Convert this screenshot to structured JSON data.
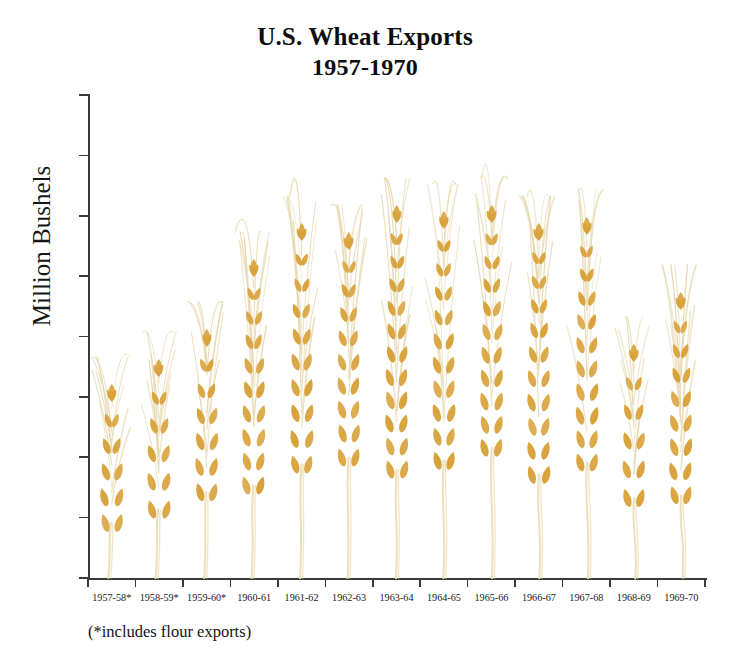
{
  "title": {
    "line1": "U.S. Wheat Exports",
    "line2": "1957-1970"
  },
  "axis": {
    "ylabel": "Million Bushels",
    "yticks": [
      0,
      100,
      200,
      300,
      400,
      500,
      600,
      700,
      800
    ],
    "ylim": [
      0,
      800
    ]
  },
  "footnote": "(*includes flour exports)",
  "colors": {
    "grain": "#d9a33c",
    "grain_light": "#e8c684",
    "stem": "#ede0bd",
    "awn": "#e6d8ae",
    "axis": "#3a3a3a",
    "text": "#141414",
    "background": "#ffffff"
  },
  "chart_data": {
    "type": "bar",
    "title": "U.S. Wheat Exports 1957-1970",
    "xlabel": "",
    "ylabel": "Million Bushels",
    "ylim": [
      0,
      800
    ],
    "grid": false,
    "legend": null,
    "units": "million bushels",
    "note": "Each category is drawn as a stylized wheat stalk whose grain head height encodes the value.",
    "categories": [
      "1957-58*",
      "1958-59*",
      "1959-60*",
      "1960-61",
      "1961-62",
      "1962-63",
      "1963-64",
      "1964-65",
      "1965-66",
      "1966-67",
      "1967-68",
      "1968-69",
      "1969-70"
    ],
    "values": [
      303,
      345,
      394,
      510,
      570,
      555,
      600,
      590,
      600,
      570,
      580,
      370,
      455
    ]
  }
}
